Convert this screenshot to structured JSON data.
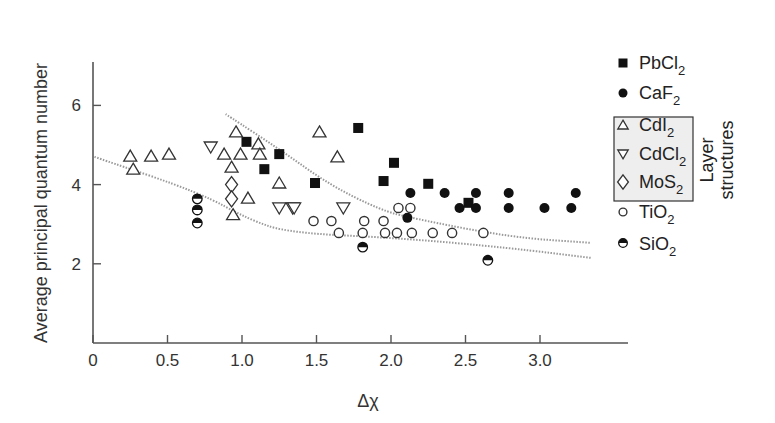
{
  "chart_data": {
    "type": "scatter",
    "title": "",
    "xlabel": "Δχ",
    "ylabel": "Average principal quantum number",
    "xlim": [
      0,
      3.3
    ],
    "ylim": [
      0,
      7
    ],
    "xticks": [
      "0",
      "0.5",
      "1.0",
      "1.5",
      "2.0",
      "2.5",
      "3.0"
    ],
    "xtick_values": [
      0,
      0.5,
      1.0,
      1.5,
      2.0,
      2.5,
      3.0
    ],
    "yticks": [
      "2",
      "4",
      "6"
    ],
    "ytick_values": [
      2,
      4,
      6
    ],
    "grid": false,
    "legend_position": "right",
    "legend_group_label": "Layer structures",
    "series": [
      {
        "name": "PbCl2",
        "marker": "filled-square",
        "points": [
          [
            1.03,
            5.08
          ],
          [
            1.25,
            4.77
          ],
          [
            1.15,
            4.39
          ],
          [
            1.78,
            5.43
          ],
          [
            2.02,
            4.55
          ],
          [
            1.49,
            4.04
          ],
          [
            1.95,
            4.09
          ],
          [
            2.25,
            4.02
          ],
          [
            2.52,
            3.54
          ]
        ]
      },
      {
        "name": "CaF2",
        "marker": "filled-circle",
        "points": [
          [
            2.13,
            3.79
          ],
          [
            2.36,
            3.79
          ],
          [
            2.57,
            3.79
          ],
          [
            2.79,
            3.79
          ],
          [
            3.24,
            3.79
          ],
          [
            2.46,
            3.41
          ],
          [
            2.57,
            3.41
          ],
          [
            2.79,
            3.41
          ],
          [
            3.03,
            3.41
          ],
          [
            3.21,
            3.41
          ],
          [
            2.11,
            3.16
          ]
        ]
      },
      {
        "name": "CdI2",
        "marker": "open-triangle-up",
        "points": [
          [
            0.25,
            4.72
          ],
          [
            0.39,
            4.72
          ],
          [
            0.51,
            4.77
          ],
          [
            0.27,
            4.39
          ],
          [
            0.96,
            5.33
          ],
          [
            1.11,
            5.03
          ],
          [
            0.88,
            4.77
          ],
          [
            0.99,
            4.77
          ],
          [
            1.12,
            4.77
          ],
          [
            0.93,
            4.44
          ],
          [
            1.25,
            4.04
          ],
          [
            1.04,
            3.66
          ],
          [
            0.94,
            3.24
          ],
          [
            1.52,
            5.33
          ],
          [
            1.64,
            4.7
          ]
        ]
      },
      {
        "name": "CdCl2",
        "marker": "open-triangle-down",
        "points": [
          [
            0.79,
            4.95
          ],
          [
            1.25,
            3.41
          ],
          [
            1.34,
            3.41
          ],
          [
            1.35,
            3.41
          ],
          [
            1.68,
            3.41
          ]
        ]
      },
      {
        "name": "MoS2",
        "marker": "open-diamond",
        "points": [
          [
            0.93,
            4.0
          ],
          [
            0.93,
            3.64
          ]
        ]
      },
      {
        "name": "TiO2",
        "marker": "open-circle",
        "points": [
          [
            1.48,
            3.08
          ],
          [
            1.6,
            3.08
          ],
          [
            1.82,
            3.08
          ],
          [
            1.95,
            3.08
          ],
          [
            1.65,
            2.78
          ],
          [
            1.81,
            2.78
          ],
          [
            1.96,
            2.78
          ],
          [
            2.04,
            2.78
          ],
          [
            2.14,
            2.78
          ],
          [
            2.28,
            2.78
          ],
          [
            2.41,
            2.78
          ],
          [
            2.62,
            2.78
          ],
          [
            2.05,
            3.41
          ],
          [
            2.13,
            3.41
          ]
        ]
      },
      {
        "name": "SiO2",
        "marker": "half-filled-circle",
        "points": [
          [
            0.7,
            3.64
          ],
          [
            0.7,
            3.36
          ],
          [
            0.7,
            3.03
          ],
          [
            1.81,
            2.42
          ],
          [
            2.65,
            2.09
          ]
        ]
      }
    ],
    "annotations": [
      {
        "type": "dotted-curve",
        "label": "upper boundary",
        "points": [
          [
            0.89,
            5.78
          ],
          [
            1.26,
            4.87
          ],
          [
            1.59,
            3.99
          ],
          [
            1.93,
            3.36
          ],
          [
            2.13,
            3.16
          ],
          [
            2.8,
            2.67
          ],
          [
            3.34,
            2.53
          ]
        ]
      },
      {
        "type": "dotted-curve",
        "label": "lower boundary",
        "points": [
          [
            0.01,
            4.7
          ],
          [
            0.72,
            3.79
          ],
          [
            1.05,
            3.11
          ],
          [
            1.32,
            2.78
          ],
          [
            2.06,
            2.65
          ],
          [
            2.8,
            2.4
          ],
          [
            3.34,
            2.15
          ]
        ]
      }
    ]
  },
  "legend": {
    "items": [
      {
        "label": "PbCl",
        "sub": "2",
        "marker": "filled-square"
      },
      {
        "label": "CaF",
        "sub": "2",
        "marker": "filled-circle"
      },
      {
        "label": "CdI",
        "sub": "2",
        "marker": "open-triangle-up"
      },
      {
        "label": "CdCl",
        "sub": "2",
        "marker": "open-triangle-down"
      },
      {
        "label": "MoS",
        "sub": "2",
        "marker": "open-diamond"
      },
      {
        "label": "TiO",
        "sub": "2",
        "marker": "open-circle"
      },
      {
        "label": "SiO",
        "sub": "2",
        "marker": "half-filled-circle"
      }
    ],
    "group_label_line1": "Layer",
    "group_label_line2": "structures"
  },
  "colors": {
    "ink": "#111111",
    "axis": "#555555",
    "curve": "#9a9a9a",
    "legend_box_fill": "#eeeeee"
  }
}
